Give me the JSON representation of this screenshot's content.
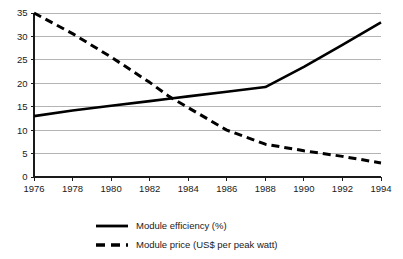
{
  "chart_data": {
    "type": "line",
    "title": "",
    "subtitle": "",
    "xlabel": "",
    "ylabel": "",
    "xlim": [
      1976,
      1994
    ],
    "ylim": [
      0,
      35
    ],
    "grid": true,
    "legend_position": "bottom-left",
    "x": [
      1976,
      1978,
      1980,
      1982,
      1983,
      1984,
      1986,
      1988,
      1990,
      1992,
      1994
    ],
    "xticks": [
      "1976",
      "1978",
      "1980",
      "1982",
      "1984",
      "1986",
      "1988",
      "1990",
      "1992",
      "1994"
    ],
    "xtick_values": [
      1976,
      1978,
      1980,
      1982,
      1984,
      1986,
      1988,
      1990,
      1992,
      1994
    ],
    "yticks": [
      "0",
      "5",
      "10",
      "15",
      "20",
      "25",
      "30",
      "35"
    ],
    "ytick_values": [
      0,
      5,
      10,
      15,
      20,
      25,
      30,
      35
    ],
    "series": [
      {
        "name": "Module efficiency (%)",
        "style": "solid",
        "color": "#000000",
        "x": [
          1976,
          1978,
          1980,
          1982,
          1983,
          1984,
          1986,
          1988,
          1990,
          1992,
          1994
        ],
        "values": [
          13.0,
          14.2,
          15.2,
          16.2,
          16.7,
          17.2,
          18.2,
          19.2,
          23.5,
          28.2,
          33.0
        ]
      },
      {
        "name": "Module price (US$ per peak watt)",
        "style": "dashed",
        "color": "#000000",
        "x": [
          1976,
          1978,
          1980,
          1982,
          1983,
          1984,
          1986,
          1988,
          1990,
          1992,
          1994
        ],
        "values": [
          35.0,
          30.6,
          25.6,
          20.2,
          17.2,
          14.8,
          10.0,
          7.0,
          5.6,
          4.4,
          3.0
        ]
      }
    ],
    "annotations": []
  },
  "legend": {
    "entries": [
      {
        "label": "Module efficiency (%)",
        "style": "solid"
      },
      {
        "label": "Module price (US$ per peak watt)",
        "style": "dashed"
      }
    ]
  },
  "colors": {
    "background": "#ffffff",
    "grid": "#b4b4b4",
    "axis": "#1a1a1a",
    "series": "#000000"
  }
}
